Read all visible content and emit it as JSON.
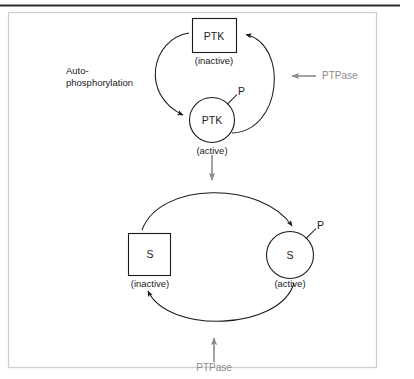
{
  "figure": {
    "width": 414,
    "height": 379,
    "colors": {
      "background": "#ffffff",
      "stroke": "#1a1a1a",
      "frame_border": "#cfcfcf",
      "top_rule": "#2b2b2b",
      "enzyme_gray": "#8c8c8c"
    }
  },
  "upper_cycle": {
    "name": "PTK autophosphorylation cycle",
    "inactive_node": {
      "shape": "square",
      "label": "PTK",
      "state": "(inactive)"
    },
    "active_node": {
      "shape": "circle",
      "label": "PTK",
      "state": "(active)",
      "phosphate": "P"
    },
    "forward_label_line1": "Auto-",
    "forward_label_line2": "phosphorylation",
    "reverse_enzyme": "PTPase"
  },
  "linker": {
    "name": "activation-arrow",
    "direction": "down"
  },
  "lower_cycle": {
    "name": "Substrate phosphorylation cycle",
    "inactive_node": {
      "shape": "square",
      "label": "S",
      "state": "(inactive)"
    },
    "active_node": {
      "shape": "circle",
      "label": "S",
      "state": "(active)",
      "phosphate": "P"
    },
    "reverse_enzyme": "PTPase"
  }
}
